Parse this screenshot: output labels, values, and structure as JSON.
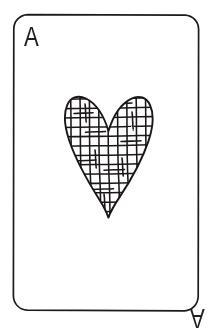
{
  "card": {
    "name": "Ace of Hearts",
    "rank": "A",
    "suit": "hearts",
    "suit_symbol": "heart-symbol",
    "style": "hand-drawn line art",
    "corner_rank_top_left": "A",
    "corner_rank_bottom_right": "A",
    "bottom_rank_rotated_180": true,
    "colors": {
      "background": "#ffffff",
      "card_face": "#ffffff",
      "ink": "#211f1f",
      "border": "#1d1b1b",
      "hatch": "#1a1818"
    },
    "geometry": {
      "image_width": 215,
      "image_height": 328,
      "card_left": 13,
      "card_top": 14,
      "card_right": 199,
      "card_bottom": 311,
      "corner_radius": 14,
      "border_width": 1.6
    },
    "pip": {
      "shape": "heart",
      "count": 1,
      "center_x": 108,
      "top_y": 97,
      "bottom_y": 218,
      "left_x": 66,
      "right_x": 152,
      "notch_y": 131,
      "fill_pattern": "irregular-crosshatch-grid",
      "hatch_cell_size": 9,
      "outline_width": 1.8
    }
  }
}
